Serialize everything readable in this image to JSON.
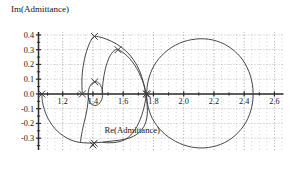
{
  "chart_data": {
    "type": "line",
    "title": "",
    "ylabel": "Im(Admittance)",
    "xlabel": "Re(Admittance)",
    "xlim": [
      1.04,
      2.66
    ],
    "ylim": [
      -0.38,
      0.42
    ],
    "xticks": [
      1.2,
      1.4,
      1.6,
      1.8,
      2.0,
      2.2,
      2.4,
      2.6
    ],
    "xticklabels": [
      "1.2",
      "1.4",
      "1.6",
      "1.8",
      "2.0",
      "2.2",
      "2.4",
      "2.6"
    ],
    "yticks": [
      0.4,
      0.3,
      0.2,
      0.1,
      0.0,
      -0.1,
      -0.2,
      -0.3
    ],
    "yticklabels": [
      "0.4",
      "0.3",
      "0.2",
      "0.1",
      "0.0",
      "-0.1",
      "-0.2",
      "-0.3"
    ],
    "grid": true,
    "grid_style": "dotted",
    "legend": "none",
    "line_color": "#3c3c3c",
    "axis_color": "#2b2b2b",
    "grid_color": "#9a9a9a",
    "marker": "x",
    "series": [
      {
        "name": "loop-1-large-right",
        "comment": "large near-circular admittance loop on the right",
        "points": [
          [
            1.755,
            0.005
          ],
          [
            1.76,
            0.06
          ],
          [
            1.772,
            0.115
          ],
          [
            1.792,
            0.168
          ],
          [
            1.82,
            0.218
          ],
          [
            1.856,
            0.262
          ],
          [
            1.898,
            0.3
          ],
          [
            1.946,
            0.331
          ],
          [
            1.998,
            0.354
          ],
          [
            2.052,
            0.368
          ],
          [
            2.108,
            0.374
          ],
          [
            2.164,
            0.371
          ],
          [
            2.218,
            0.359
          ],
          [
            2.268,
            0.338
          ],
          [
            2.314,
            0.309
          ],
          [
            2.356,
            0.272
          ],
          [
            2.392,
            0.228
          ],
          [
            2.42,
            0.178
          ],
          [
            2.441,
            0.124
          ],
          [
            2.454,
            0.066
          ],
          [
            2.459,
            0.006
          ],
          [
            2.456,
            -0.054
          ],
          [
            2.444,
            -0.112
          ],
          [
            2.424,
            -0.167
          ],
          [
            2.396,
            -0.217
          ],
          [
            2.36,
            -0.262
          ],
          [
            2.318,
            -0.3
          ],
          [
            2.27,
            -0.33
          ],
          [
            2.218,
            -0.351
          ],
          [
            2.163,
            -0.363
          ],
          [
            2.108,
            -0.366
          ],
          [
            2.052,
            -0.36
          ],
          [
            1.998,
            -0.345
          ],
          [
            1.947,
            -0.322
          ],
          [
            1.9,
            -0.292
          ],
          [
            1.858,
            -0.256
          ],
          [
            1.822,
            -0.214
          ],
          [
            1.793,
            -0.167
          ],
          [
            1.773,
            -0.116
          ],
          [
            1.76,
            -0.062
          ],
          [
            1.755,
            -0.006
          ]
        ]
      },
      {
        "name": "loop-2-mid",
        "comment": "second loop spanning approx 1.44 to 1.78",
        "points": [
          [
            1.752,
            0.003
          ],
          [
            1.738,
            0.06
          ],
          [
            1.716,
            0.118
          ],
          [
            1.69,
            0.172
          ],
          [
            1.66,
            0.218
          ],
          [
            1.628,
            0.256
          ],
          [
            1.596,
            0.284
          ],
          [
            1.572,
            0.298
          ],
          [
            1.556,
            0.302
          ],
          [
            1.54,
            0.294
          ],
          [
            1.524,
            0.276
          ],
          [
            1.508,
            0.248
          ],
          [
            1.494,
            0.212
          ],
          [
            1.482,
            0.17
          ],
          [
            1.473,
            0.124
          ],
          [
            1.466,
            0.076
          ],
          [
            1.462,
            0.028
          ],
          [
            1.46,
            -0.002
          ]
        ]
      },
      {
        "name": "loop-2-lower",
        "comment": "lower return arc of second loop",
        "points": [
          [
            1.752,
            -0.004
          ],
          [
            1.744,
            -0.062
          ],
          [
            1.73,
            -0.12
          ],
          [
            1.712,
            -0.174
          ],
          [
            1.69,
            -0.222
          ],
          [
            1.664,
            -0.262
          ],
          [
            1.636,
            -0.292
          ],
          [
            1.606,
            -0.312
          ],
          [
            1.572,
            -0.324
          ],
          [
            1.536,
            -0.33
          ],
          [
            1.5,
            -0.331
          ],
          [
            1.466,
            -0.329
          ]
        ]
      },
      {
        "name": "loop-3-tall",
        "comment": "tall loop peaking near 0.39 at x=1.38",
        "points": [
          [
            1.33,
            0.0
          ],
          [
            1.327,
            0.058
          ],
          [
            1.328,
            0.118
          ],
          [
            1.334,
            0.178
          ],
          [
            1.344,
            0.236
          ],
          [
            1.358,
            0.29
          ],
          [
            1.375,
            0.338
          ],
          [
            1.392,
            0.372
          ],
          [
            1.406,
            0.388
          ],
          [
            1.424,
            0.39
          ],
          [
            1.452,
            0.384
          ],
          [
            1.486,
            0.373
          ],
          [
            1.52,
            0.358
          ],
          [
            1.554,
            0.34
          ],
          [
            1.586,
            0.318
          ],
          [
            1.616,
            0.293
          ],
          [
            1.644,
            0.264
          ],
          [
            1.668,
            0.232
          ],
          [
            1.69,
            0.196
          ],
          [
            1.708,
            0.158
          ],
          [
            1.722,
            0.118
          ],
          [
            1.734,
            0.076
          ],
          [
            1.742,
            0.036
          ],
          [
            1.748,
            0.002
          ]
        ]
      },
      {
        "name": "loop-4-outer-left",
        "comment": "broad outer arc from left X marker down and right",
        "points": [
          [
            1.062,
            0.0
          ],
          [
            1.066,
            -0.052
          ],
          [
            1.078,
            -0.104
          ],
          [
            1.096,
            -0.152
          ],
          [
            1.12,
            -0.196
          ],
          [
            1.148,
            -0.234
          ],
          [
            1.18,
            -0.266
          ],
          [
            1.216,
            -0.292
          ],
          [
            1.254,
            -0.312
          ],
          [
            1.294,
            -0.325
          ],
          [
            1.336,
            -0.331
          ],
          [
            1.378,
            -0.333
          ],
          [
            1.42,
            -0.331
          ],
          [
            1.46,
            -0.327
          ],
          [
            1.5,
            -0.322
          ],
          [
            1.54,
            -0.318
          ],
          [
            1.578,
            -0.313
          ],
          [
            1.616,
            -0.306
          ],
          [
            1.652,
            -0.294
          ],
          [
            1.686,
            -0.276
          ],
          [
            1.714,
            -0.252
          ],
          [
            1.736,
            -0.222
          ],
          [
            1.75,
            -0.188
          ],
          [
            1.758,
            -0.15
          ],
          [
            1.76,
            -0.11
          ],
          [
            1.758,
            -0.07
          ],
          [
            1.754,
            -0.03
          ],
          [
            1.752,
            -0.002
          ]
        ]
      },
      {
        "name": "loop-5-small",
        "comment": "small tight loop between 1.36 and 1.47",
        "points": [
          [
            1.368,
            0.002
          ],
          [
            1.372,
            0.03
          ],
          [
            1.382,
            0.056
          ],
          [
            1.396,
            0.074
          ],
          [
            1.413,
            0.083
          ],
          [
            1.43,
            0.08
          ],
          [
            1.446,
            0.066
          ],
          [
            1.457,
            0.044
          ],
          [
            1.463,
            0.018
          ],
          [
            1.464,
            -0.01
          ],
          [
            1.458,
            -0.038
          ],
          [
            1.446,
            -0.06
          ],
          [
            1.43,
            -0.074
          ],
          [
            1.412,
            -0.078
          ],
          [
            1.394,
            -0.072
          ],
          [
            1.38,
            -0.056
          ],
          [
            1.371,
            -0.034
          ],
          [
            1.368,
            -0.008
          ]
        ]
      },
      {
        "name": "tail-lower-left",
        "comment": "curve descending from small loop region to lower arc",
        "points": [
          [
            1.372,
            0.004
          ],
          [
            1.368,
            -0.046
          ],
          [
            1.362,
            -0.098
          ],
          [
            1.352,
            -0.15
          ],
          [
            1.34,
            -0.2
          ],
          [
            1.33,
            -0.248
          ],
          [
            1.322,
            -0.292
          ],
          [
            1.318,
            -0.326
          ]
        ]
      }
    ],
    "markers": [
      {
        "x": 1.062,
        "y": 0.0,
        "label": "x"
      },
      {
        "x": 1.33,
        "y": 0.0,
        "label": "x"
      },
      {
        "x": 1.412,
        "y": 0.082,
        "label": "x"
      },
      {
        "x": 1.41,
        "y": 0.39,
        "label": "x"
      },
      {
        "x": 1.566,
        "y": 0.3,
        "label": "x"
      },
      {
        "x": 1.752,
        "y": 0.0,
        "label": "x"
      },
      {
        "x": 1.76,
        "y": -0.002,
        "label": "x"
      },
      {
        "x": 1.408,
        "y": -0.334,
        "label": "x"
      },
      {
        "x": 1.4,
        "y": -0.346,
        "label": "x"
      }
    ]
  }
}
